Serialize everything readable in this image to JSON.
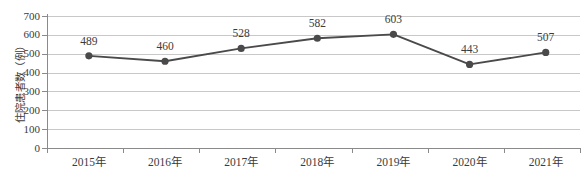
{
  "chart_data": {
    "type": "line",
    "title": "",
    "xlabel": "",
    "ylabel": "住院患者数（例）",
    "categories": [
      "2015年",
      "2016年",
      "2017年",
      "2018年",
      "2019年",
      "2020年",
      "2021年"
    ],
    "values": [
      489,
      460,
      528,
      582,
      603,
      443,
      507
    ],
    "point_labels": [
      "489",
      "460",
      "528",
      "582",
      "603",
      "443",
      "507"
    ],
    "ylim": [
      0,
      700
    ],
    "ytick_step": 100,
    "ytick_labels": [
      "700",
      "600",
      "500",
      "400",
      "300",
      "200",
      "100",
      "0"
    ],
    "ytick_values": [
      700,
      600,
      500,
      400,
      300,
      200,
      100,
      0
    ],
    "grid": true,
    "grid_axis": "y",
    "legend": false,
    "legend_position": "none",
    "series": [
      {
        "name": "住院患者数（例）",
        "values": [
          489,
          460,
          528,
          582,
          603,
          443,
          507
        ],
        "marker": "circle",
        "line_color": "#4a4a4a",
        "marker_color": "#4a4a4a"
      }
    ],
    "colors": {
      "line": "#4a4a4a",
      "marker": "#4a4a4a",
      "gridline": "#c8c8c8",
      "axis": "#8a8a8a",
      "text": "#3b3b3b",
      "background": "#ffffff"
    }
  }
}
